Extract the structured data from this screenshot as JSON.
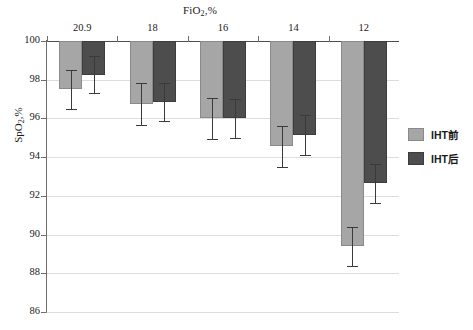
{
  "chart_data": {
    "type": "bar",
    "title": "FiO2,%",
    "title_rich": {
      "prefix": "FiO",
      "sub": "2",
      "suffix": ",%"
    },
    "xlabel": "",
    "ylabel": "SpO2,%",
    "ylabel_rich": {
      "prefix": "SpO",
      "sub": "2",
      "suffix": ",%"
    },
    "categories": [
      "20.9",
      "18",
      "16",
      "14",
      "12"
    ],
    "ylim": [
      86,
      100
    ],
    "ytick_labels": [
      "100",
      "98",
      "96",
      "94",
      "92",
      "90",
      "88",
      "86"
    ],
    "ytick_values": [
      100,
      98,
      96,
      94,
      92,
      90,
      88,
      86
    ],
    "grid": true,
    "legend_position": "right",
    "bars_descend_from_top": true,
    "series": [
      {
        "name": "IHT前",
        "color": "#a6a6a6",
        "values": [
          97.5,
          96.75,
          96.0,
          94.55,
          89.4
        ],
        "errors": [
          1.0,
          1.1,
          1.05,
          1.05,
          1.0
        ]
      },
      {
        "name": "IHT后",
        "color": "#4d4d4d",
        "values": [
          98.25,
          96.85,
          96.0,
          95.15,
          92.65
        ],
        "errors": [
          0.95,
          1.0,
          1.0,
          1.05,
          1.0
        ]
      }
    ]
  },
  "legend": {
    "items": [
      {
        "label": "IHT前",
        "color": "#a6a6a6"
      },
      {
        "label": "IHT后",
        "color": "#4d4d4d"
      }
    ]
  }
}
